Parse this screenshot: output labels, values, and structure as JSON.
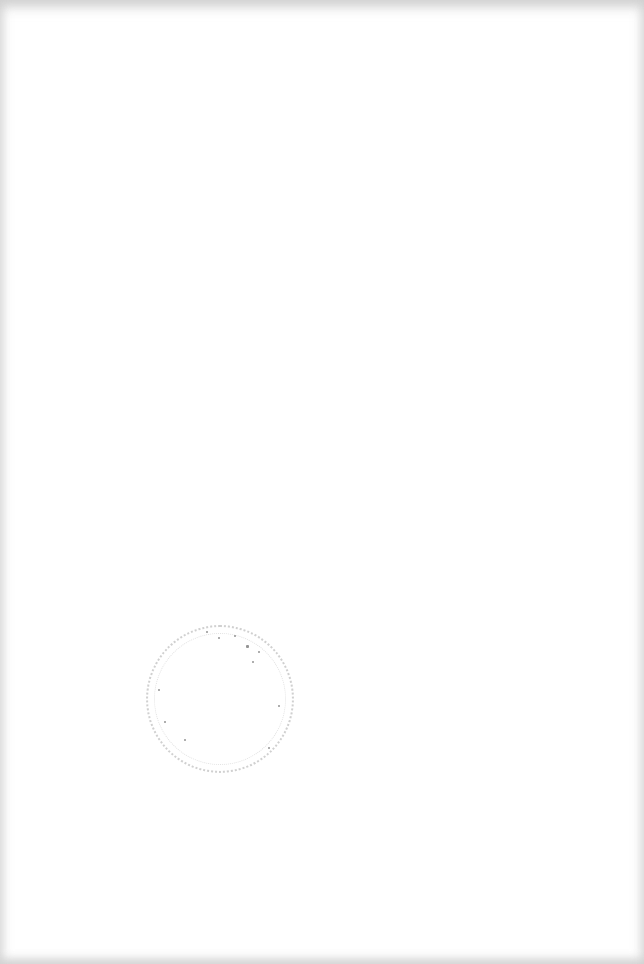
{
  "document": {
    "type": "scanned blank page",
    "background": "#ffffff",
    "edge_shading": "#c8c8c8",
    "text_content": ""
  },
  "stamp": {
    "shape": "circle",
    "style": "faint speckled dotted outline",
    "legible_text": "",
    "color": "#555555"
  }
}
